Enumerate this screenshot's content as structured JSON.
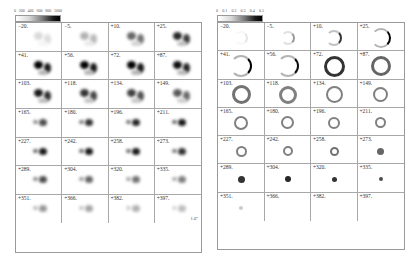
{
  "figure": {
    "left_panel": {
      "colorbar": {
        "ticks": [
          "0",
          "200",
          "400",
          "600",
          "800",
          "1000"
        ]
      },
      "scale_bar": {
        "label": "1.0\""
      },
      "frames": [
        {
          "label": "−20.",
          "intensity": 0.15,
          "form": "double"
        },
        {
          "label": "−5.",
          "intensity": 0.3,
          "form": "double"
        },
        {
          "label": "+10.",
          "intensity": 0.6,
          "form": "double"
        },
        {
          "label": "+25.",
          "intensity": 0.85,
          "form": "double"
        },
        {
          "label": "+41.",
          "intensity": 1.0,
          "form": "double"
        },
        {
          "label": "+56.",
          "intensity": 1.0,
          "form": "double"
        },
        {
          "label": "+72.",
          "intensity": 1.0,
          "form": "double"
        },
        {
          "label": "+87.",
          "intensity": 0.95,
          "form": "double"
        },
        {
          "label": "+103.",
          "intensity": 0.9,
          "form": "double"
        },
        {
          "label": "+118.",
          "intensity": 0.8,
          "form": "double"
        },
        {
          "label": "+134.",
          "intensity": 0.75,
          "form": "double"
        },
        {
          "label": "+149.",
          "intensity": 0.65,
          "form": "double"
        },
        {
          "label": "+165.",
          "intensity": 0.7,
          "form": "pair"
        },
        {
          "label": "+180.",
          "intensity": 0.8,
          "form": "pair"
        },
        {
          "label": "+196.",
          "intensity": 0.85,
          "form": "pair"
        },
        {
          "label": "+211.",
          "intensity": 0.9,
          "form": "pair"
        },
        {
          "label": "+227.",
          "intensity": 0.9,
          "form": "pair"
        },
        {
          "label": "+242.",
          "intensity": 0.9,
          "form": "pair"
        },
        {
          "label": "+258.",
          "intensity": 0.9,
          "form": "pair"
        },
        {
          "label": "+273.",
          "intensity": 0.8,
          "form": "pair"
        },
        {
          "label": "+289.",
          "intensity": 0.7,
          "form": "pair"
        },
        {
          "label": "+304.",
          "intensity": 0.6,
          "form": "pair"
        },
        {
          "label": "+320.",
          "intensity": 0.55,
          "form": "pair"
        },
        {
          "label": "+335.",
          "intensity": 0.5,
          "form": "pair"
        },
        {
          "label": "+351.",
          "intensity": 0.4,
          "form": "pair"
        },
        {
          "label": "+366.",
          "intensity": 0.35,
          "form": "pair"
        },
        {
          "label": "+382.",
          "intensity": 0.3,
          "form": "pair"
        },
        {
          "label": "+397.",
          "intensity": 0.25,
          "form": "pair"
        }
      ]
    },
    "right_panel": {
      "colorbar": {
        "ticks": [
          "0",
          "0.1",
          "0.2",
          "0.3",
          "0.4",
          "0.5"
        ]
      },
      "frames": [
        {
          "label": "−20.",
          "form": "arc",
          "size": 14,
          "intensity": 0.1
        },
        {
          "label": "−5.",
          "form": "arc",
          "size": 14,
          "intensity": 0.4
        },
        {
          "label": "+10.",
          "form": "arc",
          "size": 16,
          "intensity": 0.8
        },
        {
          "label": "+25.",
          "form": "arc",
          "size": 20,
          "intensity": 1.0
        },
        {
          "label": "+41.",
          "form": "arc",
          "size": 22,
          "intensity": 1.0
        },
        {
          "label": "+56.",
          "form": "arc",
          "size": 22,
          "intensity": 0.95
        },
        {
          "label": "+72.",
          "form": "ring",
          "size": 21,
          "intensity": 0.8
        },
        {
          "label": "+87.",
          "form": "ring",
          "size": 20,
          "intensity": 0.6
        },
        {
          "label": "+103.",
          "form": "ring",
          "size": 19,
          "intensity": 0.55
        },
        {
          "label": "+118.",
          "form": "ring",
          "size": 18,
          "intensity": 0.5
        },
        {
          "label": "+134.",
          "form": "ring",
          "size": 17,
          "intensity": 0.5
        },
        {
          "label": "+149.",
          "form": "ring",
          "size": 15,
          "intensity": 0.5
        },
        {
          "label": "+165.",
          "form": "ring",
          "size": 14,
          "intensity": 0.5
        },
        {
          "label": "+180.",
          "form": "ring",
          "size": 13,
          "intensity": 0.5
        },
        {
          "label": "+196.",
          "form": "ring",
          "size": 12,
          "intensity": 0.5
        },
        {
          "label": "+211.",
          "form": "ring",
          "size": 11,
          "intensity": 0.5
        },
        {
          "label": "+227.",
          "form": "ring",
          "size": 11,
          "intensity": 0.5
        },
        {
          "label": "+242.",
          "form": "ring",
          "size": 10,
          "intensity": 0.5
        },
        {
          "label": "+258.",
          "form": "ring",
          "size": 9,
          "intensity": 0.55
        },
        {
          "label": "+273.",
          "form": "dot",
          "size": 7,
          "intensity": 0.6
        },
        {
          "label": "+289.",
          "form": "dot",
          "size": 7,
          "intensity": 0.8
        },
        {
          "label": "+304.",
          "form": "dot",
          "size": 6,
          "intensity": 0.85
        },
        {
          "label": "+320.",
          "form": "dot",
          "size": 5,
          "intensity": 0.8
        },
        {
          "label": "+335.",
          "form": "dot",
          "size": 4,
          "intensity": 0.7
        },
        {
          "label": "+351.",
          "form": "dot",
          "size": 4,
          "intensity": 0.2
        },
        {
          "label": "+366.",
          "form": "none",
          "size": 0,
          "intensity": 0
        },
        {
          "label": "+382.",
          "form": "none",
          "size": 0,
          "intensity": 0
        },
        {
          "label": "+397.",
          "form": "none",
          "size": 0,
          "intensity": 0
        }
      ]
    }
  }
}
